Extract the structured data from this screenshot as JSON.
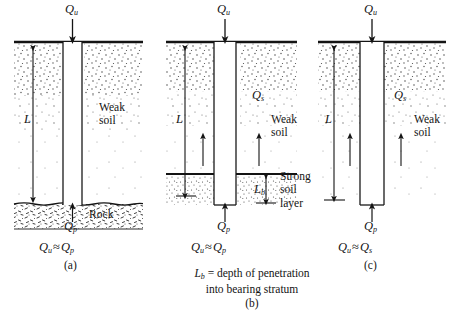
{
  "figure": {
    "panels": [
      {
        "id": "a",
        "caption": "(a)",
        "equation_load": "Q",
        "equation_load_sub": "u",
        "length_label": "L",
        "soil_label": "Weak\nsoil",
        "bearing_label": "Rock",
        "tip_label": "Q",
        "tip_label_sub": "p",
        "result_left": "Q",
        "result_left_sub": "u",
        "result_op": "≈",
        "result_right": "Q",
        "result_right_sub": "p"
      },
      {
        "id": "b",
        "caption": "(b)",
        "equation_load": "Q",
        "equation_load_sub": "u",
        "length_label": "L",
        "soil_label": "Weak\nsoil",
        "skin_label": "Q",
        "skin_label_sub": "s",
        "bearing_label": "Strong\nsoil\nlayer",
        "penetration_label": "L",
        "penetration_label_sub": "b",
        "tip_label": "Q",
        "tip_label_sub": "p",
        "result_left": "Q",
        "result_left_sub": "u",
        "result_op": "≈",
        "result_right": "Q",
        "result_right_sub": "p",
        "note_line1_symbol": "L",
        "note_line1_symbol_sub": "b",
        "note_line1_text": " = depth of penetration",
        "note_line2_text": "into bearing stratum"
      },
      {
        "id": "c",
        "caption": "(c)",
        "equation_load": "Q",
        "equation_load_sub": "u",
        "length_label": "L",
        "soil_label": "Weak\nsoil",
        "skin_label": "Q",
        "skin_label_sub": "s",
        "tip_label": "Q",
        "tip_label_sub": "p",
        "result_left": "Q",
        "result_left_sub": "u",
        "result_op": "≈",
        "result_right": "Q",
        "result_right_sub": "s"
      }
    ],
    "colors": {
      "ink": "#141414",
      "line": "#1a1a1a",
      "stipple": "#555555",
      "background": "#ffffff"
    }
  }
}
